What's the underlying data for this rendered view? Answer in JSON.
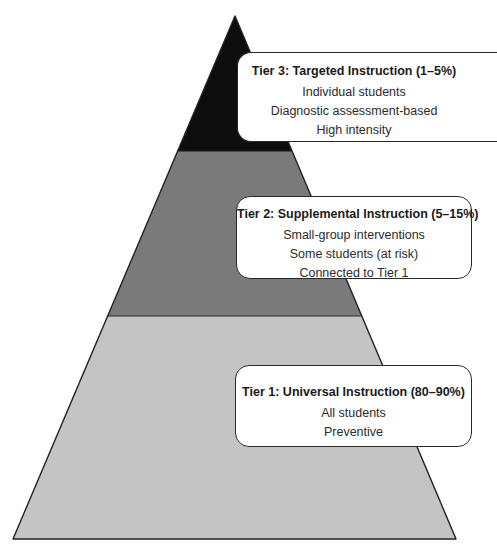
{
  "diagram": {
    "type": "pyramid",
    "colors": {
      "tier3_fill": "#0d0d0d",
      "tier2_fill": "#7a7a7a",
      "tier1_fill": "#c4c4c4",
      "outline": "#222222",
      "box_fill": "#ffffff",
      "box_border": "#2a2a2a"
    },
    "tiers": [
      {
        "level": 3,
        "title": "Tier 3: Targeted Instruction (1–5%)",
        "lines": [
          "Individual students",
          "Diagnostic assessment-based",
          "High intensity"
        ]
      },
      {
        "level": 2,
        "title": "Tier 2: Supplemental Instruction (5–15%)",
        "lines": [
          "Small-group interventions",
          "Some students (at risk)",
          "Connected to Tier 1"
        ]
      },
      {
        "level": 1,
        "title": "Tier 1: Universal Instruction (80–90%)",
        "lines": [
          "All students",
          "Preventive"
        ]
      }
    ]
  }
}
